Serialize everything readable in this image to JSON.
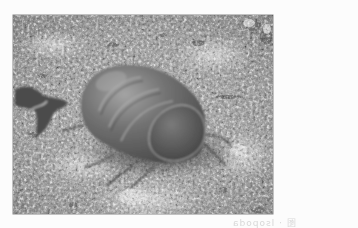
{
  "image": {
    "subject": "pill bug (isopod) on gravelly soil",
    "style": "grayscale photograph",
    "alt": "Close-up photo of a segmented pill bug crawling on gravel, with a dried leaf fragment to the left"
  },
  "photo_frame": {
    "x": 13,
    "y": 15,
    "width": 260,
    "height": 199
  },
  "colors": {
    "paper": "#fcfcfc",
    "ground_light": "#c8c8c8",
    "ground_mid": "#9a9a9a",
    "ground_dark": "#5a5a5a",
    "bug_body": "#6e6e6e",
    "bug_highlight": "#9c9c9c",
    "bug_shadow": "#3c3c3c",
    "showthrough_text": "#d8d8d8"
  },
  "showthrough": {
    "text": "图 · Isopoda"
  }
}
